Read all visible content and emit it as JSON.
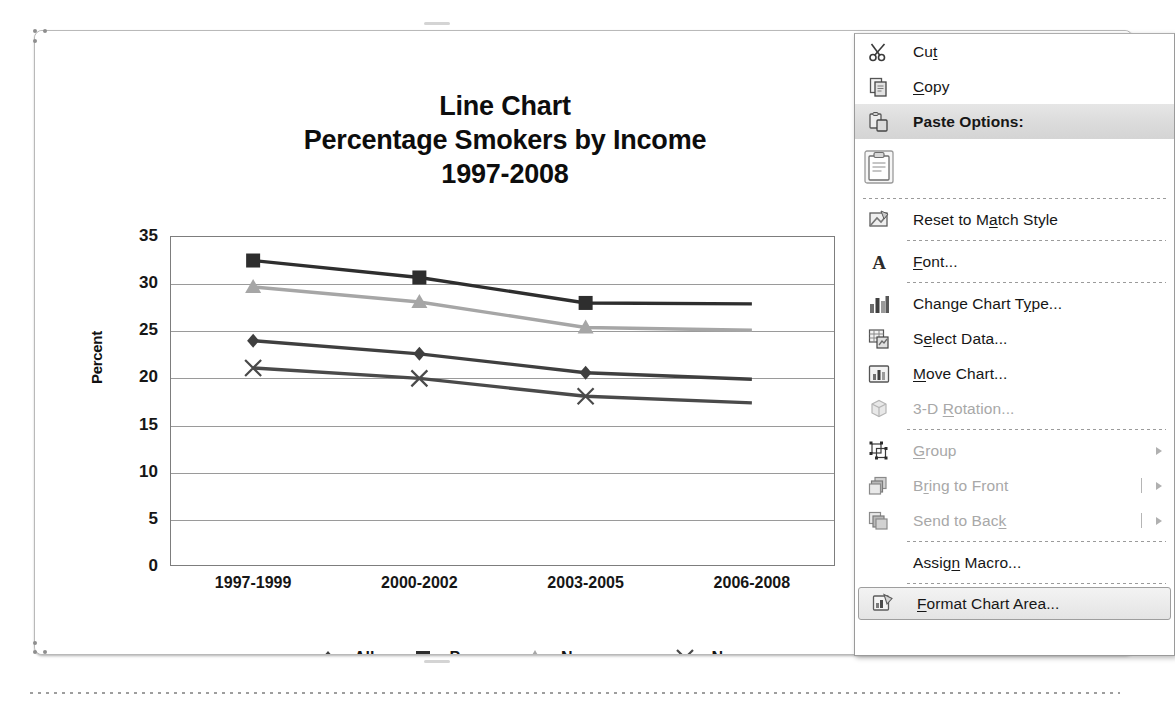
{
  "chart_data": {
    "type": "line",
    "title": [
      "Line Chart",
      "Percentage Smokers by Income",
      "1997-2008"
    ],
    "title_line1": "Line Chart",
    "title_line2": "Percentage Smokers by Income",
    "title_line3": "1997-2008",
    "xlabel": "",
    "ylabel": "Percent",
    "ylim": [
      0,
      35
    ],
    "ytick_values": [
      35,
      30,
      25,
      20,
      15,
      10,
      5,
      0
    ],
    "grid": true,
    "legend_position": "bottom",
    "categories": [
      "1997-1999",
      "2000-2002",
      "2003-2005",
      "2006-2008"
    ],
    "visible_categories": [
      "1997-1999",
      "2000-2002",
      "2003-2005"
    ],
    "series": [
      {
        "name": "All",
        "marker": "diamond",
        "color": "#3f3f3f",
        "values": [
          23.9,
          22.5,
          20.5,
          19.8
        ]
      },
      {
        "name": "Poor",
        "marker": "square",
        "color": "#2e2e2e",
        "values": [
          32.4,
          30.6,
          27.9,
          27.8
        ]
      },
      {
        "name": "Near poor",
        "marker": "triangle",
        "color": "#a6a6a6",
        "values": [
          29.6,
          28.0,
          25.3,
          25.0
        ]
      },
      {
        "name": "Nonpoor",
        "marker": "cross",
        "color": "#4a4a4a",
        "values": [
          21.0,
          19.9,
          18.0,
          17.3
        ]
      }
    ]
  },
  "context_menu": {
    "items": [
      {
        "label": "Cut",
        "icon": "scissors-icon",
        "accel": "t",
        "state": "enabled",
        "submenu": false,
        "separator_after": false
      },
      {
        "label": "Copy",
        "icon": "copy-icon",
        "accel": "C",
        "state": "enabled",
        "submenu": false,
        "separator_after": false
      },
      {
        "label": "Paste Options:",
        "icon": "paste-options-icon",
        "accel": "",
        "state": "header",
        "submenu": false,
        "separator_after": false
      },
      {
        "label": "",
        "icon": "paste-clipboard-icon",
        "accel": "",
        "state": "gallery",
        "submenu": false,
        "separator_after": true
      },
      {
        "label": "Reset to Match Style",
        "icon": "reset-style-icon",
        "accel": "a",
        "state": "enabled",
        "submenu": false,
        "separator_after": true
      },
      {
        "label": "Font...",
        "icon": "font-a-icon",
        "accel": "F",
        "state": "enabled",
        "submenu": false,
        "separator_after": true
      },
      {
        "label": "Change Chart Type...",
        "icon": "chart-type-icon",
        "accel": "y",
        "state": "enabled",
        "submenu": false,
        "separator_after": false
      },
      {
        "label": "Select Data...",
        "icon": "select-data-icon",
        "accel": "e",
        "state": "enabled",
        "submenu": false,
        "separator_after": false
      },
      {
        "label": "Move Chart...",
        "icon": "move-chart-icon",
        "accel": "M",
        "state": "enabled",
        "submenu": false,
        "separator_after": false
      },
      {
        "label": "3-D Rotation...",
        "icon": "cube-3d-icon",
        "accel": "R",
        "state": "disabled",
        "submenu": false,
        "separator_after": true
      },
      {
        "label": "Group",
        "icon": "group-icon",
        "accel": "G",
        "state": "disabled",
        "submenu": true,
        "separator_after": false
      },
      {
        "label": "Bring to Front",
        "icon": "bring-front-icon",
        "accel": "r",
        "state": "disabled",
        "submenu": true,
        "separator_after": false
      },
      {
        "label": "Send to Back",
        "icon": "send-back-icon",
        "accel": "k",
        "state": "disabled",
        "submenu": true,
        "separator_after": true
      },
      {
        "label": "Assign Macro...",
        "icon": "",
        "accel": "n",
        "state": "enabled",
        "submenu": false,
        "separator_after": true
      },
      {
        "label": "Format Chart Area...",
        "icon": "format-chart-icon",
        "accel": "F",
        "state": "highlighted",
        "submenu": false,
        "separator_after": false
      }
    ]
  },
  "chart_object": {
    "selected": true,
    "handle_count": 8
  },
  "colors": {
    "menu_bg": "#ffffff",
    "menu_border": "#9a9a9a",
    "header_band": "#dcdcdc",
    "highlight_bg": "#ebebeb",
    "disabled_text": "#a8a8a8",
    "text": "#161616",
    "gridline": "#9a9a9a",
    "plot_border": "#7d7d7d"
  }
}
